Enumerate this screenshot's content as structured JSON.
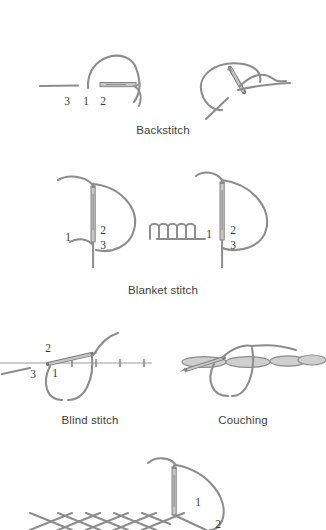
{
  "page": {
    "top_cut_text": "",
    "background_color": "#ffffff",
    "thread_color": "#8d8d8d",
    "thread_dark_color": "#6f6f6f",
    "needle_fill_color": "#c6c6c6",
    "needle_outline_color": "#7a7a7a",
    "fabric_line_color": "#bdbdbd",
    "couch_fill_color": "#cfcfcf",
    "number_color": "#3a3a3a",
    "caption_color": "#3f3f3f"
  },
  "figures": [
    {
      "id": "backstitch",
      "caption": "Backstitch",
      "numbers": [
        "3",
        "1",
        "2"
      ],
      "panels": [
        "left-start",
        "right-continue"
      ]
    },
    {
      "id": "blanket-stitch",
      "caption": "Blanket stitch",
      "numbers": [
        "1",
        "2",
        "3"
      ],
      "panels": [
        "left-single-loop",
        "right-row-of-loops"
      ]
    },
    {
      "id": "blind-stitch",
      "caption": "Blind stitch",
      "numbers": [
        "2",
        "1",
        "3"
      ],
      "panels": [
        "single"
      ]
    },
    {
      "id": "couching",
      "caption": "Couching",
      "numbers": [],
      "panels": [
        "single"
      ]
    },
    {
      "id": "cross-stitch-partial",
      "caption": "",
      "numbers": [
        "1",
        "2"
      ],
      "panels": [
        "single-cropped"
      ]
    }
  ]
}
